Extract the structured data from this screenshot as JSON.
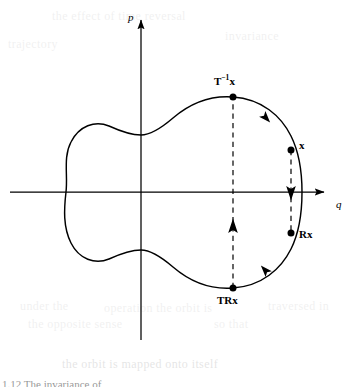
{
  "figure": {
    "kind": "phase-space-diagram",
    "background_color": "#ffffff",
    "stroke_color": "#000000",
    "axes": {
      "vertical_label": "p",
      "horizontal_label": "q",
      "vertical_axis_x": 141,
      "horizontal_axis_y": 192,
      "vertical_from_y": 340,
      "vertical_to_y": 14,
      "horizontal_from_x": 10,
      "horizontal_to_x": 330
    },
    "curve": {
      "description": "closed peanut-shaped orbit in the q-p plane",
      "leftmost_x": 66,
      "rightmost_x": 302,
      "top_y": 97,
      "bottom_y": 288,
      "waist_top_y": 135,
      "waist_bottom_y": 250,
      "path": "M 233 97 C 262 99 281 115 291 135 C 300 150 302 171 302 192 C 302 213 300 234 291 249 C 281 270 262 286 233 288 C 206 290 186 279 172 267 C 158 255 148 250 141 250 C 132 250 120 254 109 259 C 95 265 79 260 71 243 C 64 228 64 210 66 192 C 67 173 64 156 71 141 C 79 124 95 119 109 125 C 120 130 132 135 141 135 C 148 135 158 129 172 117 C 186 105 206 95 233 97 Z"
    },
    "points": [
      {
        "id": "T-inverse-x",
        "label_html": "T<sup>−1</sup>x",
        "label_text": "T⁻¹x",
        "x": 233,
        "y": 97,
        "label_x": 219,
        "label_y": 80,
        "dot_radius": 3.4
      },
      {
        "id": "x",
        "label_html": "x",
        "label_text": "x",
        "x": 291,
        "y": 150,
        "label_x": 299,
        "label_y": 139,
        "dot_radius": 3.4
      },
      {
        "id": "Rx",
        "label_html": "Rx",
        "label_text": "Rx",
        "x": 291,
        "y": 233,
        "label_x": 299,
        "label_y": 234,
        "dot_radius": 3.4
      },
      {
        "id": "TRx",
        "label_html": "TRx",
        "label_text": "TRx",
        "x": 233,
        "y": 288,
        "label_x": 219,
        "label_y": 297,
        "dot_radius": 3.4
      }
    ],
    "dashed_connectors": [
      {
        "id": "x-to-Rx",
        "x": 291,
        "from_y": 150,
        "to_y": 233,
        "arrow_direction": "down",
        "arrow_y": 196
      },
      {
        "id": "TRx-to-T-inverse-x",
        "x": 233,
        "from_y": 288,
        "to_y": 97,
        "arrow_direction": "up",
        "arrow_y": 224
      }
    ],
    "flow_arrows": [
      {
        "id": "flow-upper-right",
        "x": 266,
        "y": 118,
        "angle_deg": 48
      },
      {
        "id": "flow-lower-right",
        "x": 265,
        "y": 270,
        "angle_deg": 228
      }
    ],
    "ghost_artifacts": [
      {
        "id": "ghost-top-left",
        "text": "the effect of time reversal",
        "x": 52,
        "y": 10
      },
      {
        "id": "ghost-top-right",
        "text": "invariance",
        "x": 225,
        "y": 30
      },
      {
        "id": "ghost-mid-left",
        "text": "trajectory",
        "x": 8,
        "y": 38
      },
      {
        "id": "ghost-lower-left",
        "text": "under the",
        "x": 20,
        "y": 300
      },
      {
        "id": "ghost-lower-mid",
        "text": "operation the orbit is",
        "x": 104,
        "y": 302
      },
      {
        "id": "ghost-lower-right",
        "text": "traversed in",
        "x": 268,
        "y": 300
      },
      {
        "id": "ghost-bottom-left",
        "text": "the opposite sense",
        "x": 28,
        "y": 318
      },
      {
        "id": "ghost-bottom-right",
        "text": "so that",
        "x": 214,
        "y": 318
      },
      {
        "id": "ghost-base",
        "text": "the orbit is mapped onto itself",
        "x": 62,
        "y": 358
      }
    ],
    "caption_partial": {
      "text": "1.12  The invariance of",
      "x": 2,
      "y": 376
    }
  }
}
